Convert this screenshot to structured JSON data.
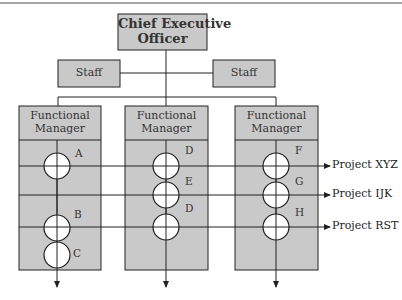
{
  "diagram": {
    "type": "matrix-organization-chart",
    "colors": {
      "box_fill": "#c9c9c9",
      "line": "#222222",
      "top_rule": "#8a8a8a",
      "circle_fill": "#ffffff"
    },
    "ceo": {
      "line1": "Chief Executive",
      "line2": "Officer"
    },
    "staff": [
      {
        "label": "Staff"
      },
      {
        "label": "Staff"
      }
    ],
    "functional_managers": [
      {
        "line1": "Functional",
        "line2": "Manager",
        "nodes": [
          {
            "label": "A"
          },
          {
            "label": "B"
          },
          {
            "label": "C"
          }
        ]
      },
      {
        "line1": "Functional",
        "line2": "Manager",
        "nodes": [
          {
            "label": "D"
          },
          {
            "label": "E"
          },
          {
            "label": "D"
          }
        ]
      },
      {
        "line1": "Functional",
        "line2": "Manager",
        "nodes": [
          {
            "label": "F"
          },
          {
            "label": "G"
          },
          {
            "label": "H"
          }
        ]
      }
    ],
    "projects": [
      {
        "label": "Project XYZ"
      },
      {
        "label": "Project IJK"
      },
      {
        "label": "Project RST"
      }
    ]
  }
}
